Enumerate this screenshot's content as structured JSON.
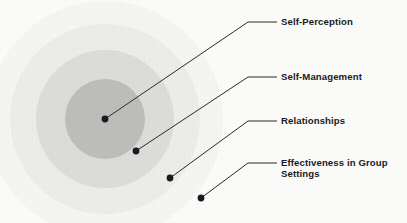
{
  "diagram": {
    "background_color": "#fbfbfa",
    "text_color": "#1c1c1c",
    "leader_line_color": "#2b2b2b",
    "dot_color": "#1a1a1a",
    "rings": [
      {
        "name": "outermost-ring",
        "color": "#f5f5f3",
        "cx": 105,
        "cy": 119,
        "r": 118
      },
      {
        "name": "outer-ring",
        "color": "#ececeb",
        "cx": 105,
        "cy": 119,
        "r": 95
      },
      {
        "name": "middle-ring",
        "color": "#dcdcda",
        "cx": 105,
        "cy": 119,
        "r": 69
      },
      {
        "name": "inner-ring",
        "color": "#bdbdbc",
        "cx": 105,
        "cy": 119,
        "r": 40
      }
    ],
    "callouts": [
      {
        "id": "self-perception",
        "label": "Self-Perception",
        "dot": {
          "x": 105,
          "y": 119
        },
        "bend": {
          "x": 248,
          "y": 22
        },
        "line_end": {
          "x": 277,
          "y": 22
        },
        "text": {
          "x": 281,
          "y": 16
        }
      },
      {
        "id": "self-management",
        "label": "Self-Management",
        "dot": {
          "x": 136,
          "y": 151
        },
        "bend": {
          "x": 248,
          "y": 77
        },
        "line_end": {
          "x": 277,
          "y": 77
        },
        "text": {
          "x": 281,
          "y": 71
        }
      },
      {
        "id": "relationships",
        "label": "Relationships",
        "dot": {
          "x": 170,
          "y": 178
        },
        "bend": {
          "x": 248,
          "y": 121
        },
        "line_end": {
          "x": 277,
          "y": 121
        },
        "text": {
          "x": 281,
          "y": 115
        }
      },
      {
        "id": "effectiveness-in-group-settings",
        "label": "Effectiveness in Group\nSettings",
        "dot": {
          "x": 201,
          "y": 198
        },
        "bend": {
          "x": 248,
          "y": 163
        },
        "line_end": {
          "x": 277,
          "y": 163
        },
        "text": {
          "x": 281,
          "y": 157
        }
      }
    ]
  }
}
